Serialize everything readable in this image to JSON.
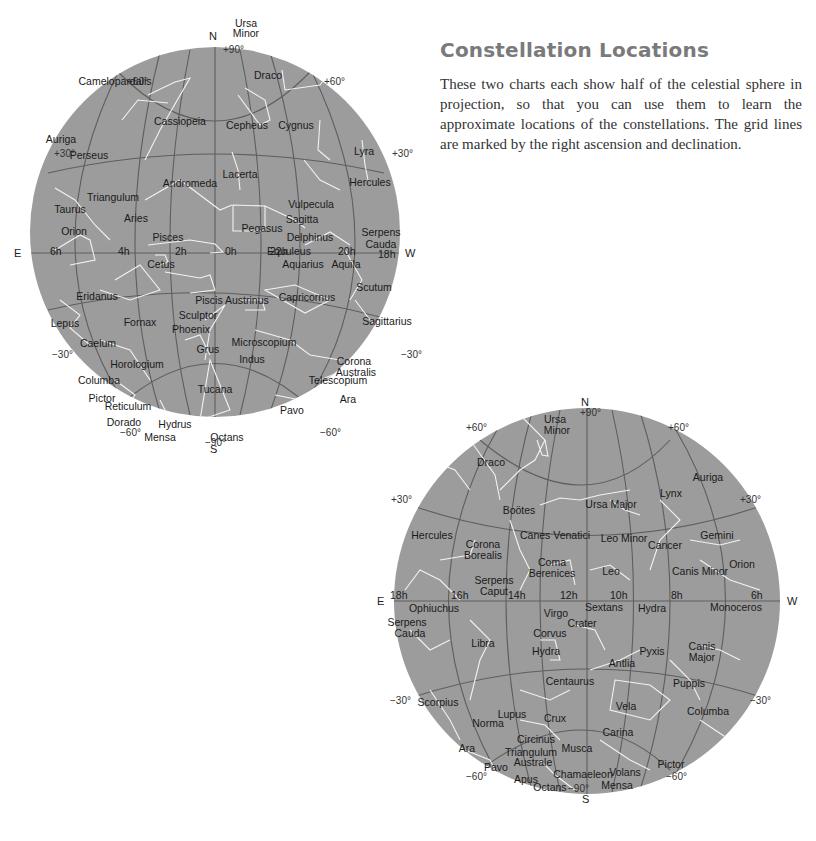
{
  "header": {
    "title": "Constellation Locations",
    "description": "These two charts each show half of the celestial sphere in projection, so that you can use them to learn the approximate locations of the constellations. The grid lines are marked by the right ascension and declination."
  },
  "colors": {
    "sphere_fill": "#9c9c9c",
    "grid_line": "#5e5e5e",
    "constellation_line": "#f2f2f2",
    "title": "#7a7a7a"
  },
  "chart1": {
    "directions": {
      "north": "N",
      "south": "S",
      "east": "E",
      "west": "W"
    },
    "dec_labels": {
      "pole_n": "+90°",
      "pole_s": "−90°",
      "p60": "+60°",
      "p30": "+30°",
      "m30": "−30°",
      "m60": "−60°"
    },
    "ra_labels": [
      "6h",
      "4h",
      "2h",
      "0h",
      "22h",
      "20h",
      "18h"
    ],
    "constellations": [
      {
        "name": "Ursa",
        "x": 246,
        "y": 27
      },
      {
        "name": "Minor",
        "x": 246,
        "y": 37
      },
      {
        "name": "Draco",
        "x": 268,
        "y": 79
      },
      {
        "name": "Camelopardalis",
        "x": 115,
        "y": 85
      },
      {
        "name": "Cassiopeia",
        "x": 180,
        "y": 125
      },
      {
        "name": "Cepheus",
        "x": 247,
        "y": 129
      },
      {
        "name": "Cygnus",
        "x": 296,
        "y": 129
      },
      {
        "name": "Auriga",
        "x": 61,
        "y": 143
      },
      {
        "name": "Perseus",
        "x": 89,
        "y": 159
      },
      {
        "name": "Lyra",
        "x": 364,
        "y": 155
      },
      {
        "name": "Lacerta",
        "x": 240,
        "y": 178
      },
      {
        "name": "Andromeda",
        "x": 190,
        "y": 187
      },
      {
        "name": "Hercules",
        "x": 370,
        "y": 186
      },
      {
        "name": "Triangulum",
        "x": 113,
        "y": 201
      },
      {
        "name": "Vulpecula",
        "x": 311,
        "y": 208
      },
      {
        "name": "Taurus",
        "x": 70,
        "y": 213
      },
      {
        "name": "Aries",
        "x": 136,
        "y": 222
      },
      {
        "name": "Sagitta",
        "x": 302,
        "y": 223
      },
      {
        "name": "Pegasus",
        "x": 262,
        "y": 232
      },
      {
        "name": "Orion",
        "x": 74,
        "y": 235
      },
      {
        "name": "Serpens",
        "x": 381,
        "y": 236
      },
      {
        "name": "Cauda",
        "x": 381,
        "y": 248
      },
      {
        "name": "Pisces",
        "x": 168,
        "y": 241
      },
      {
        "name": "Delphinus",
        "x": 310,
        "y": 241
      },
      {
        "name": "Equuleus",
        "x": 289,
        "y": 255
      },
      {
        "name": "Cetus",
        "x": 161,
        "y": 268
      },
      {
        "name": "Aquarius",
        "x": 303,
        "y": 268
      },
      {
        "name": "Aquila",
        "x": 346,
        "y": 268
      },
      {
        "name": "Eridanus",
        "x": 97,
        "y": 300
      },
      {
        "name": "Scutum",
        "x": 374,
        "y": 291
      },
      {
        "name": "Piscis Austrinus",
        "x": 232,
        "y": 304
      },
      {
        "name": "Capricornus",
        "x": 307,
        "y": 301
      },
      {
        "name": "Sculptor",
        "x": 198,
        "y": 319
      },
      {
        "name": "Sagittarius",
        "x": 387,
        "y": 325
      },
      {
        "name": "Lepus",
        "x": 65,
        "y": 327
      },
      {
        "name": "Fornax",
        "x": 140,
        "y": 326
      },
      {
        "name": "Phoenix",
        "x": 191,
        "y": 333
      },
      {
        "name": "Caelum",
        "x": 98,
        "y": 347
      },
      {
        "name": "Grus",
        "x": 208,
        "y": 353
      },
      {
        "name": "Microscopium",
        "x": 264,
        "y": 346
      },
      {
        "name": "Indus",
        "x": 252,
        "y": 363
      },
      {
        "name": "Corona",
        "x": 354,
        "y": 365
      },
      {
        "name": "Australis",
        "x": 356,
        "y": 376
      },
      {
        "name": "Horologium",
        "x": 137,
        "y": 368
      },
      {
        "name": "Columba",
        "x": 99,
        "y": 384
      },
      {
        "name": "Telescopium",
        "x": 338,
        "y": 384
      },
      {
        "name": "Tucana",
        "x": 215,
        "y": 393
      },
      {
        "name": "Pictor",
        "x": 102,
        "y": 402
      },
      {
        "name": "Ara",
        "x": 348,
        "y": 403
      },
      {
        "name": "Reticulum",
        "x": 128,
        "y": 410
      },
      {
        "name": "Pavo",
        "x": 292,
        "y": 414
      },
      {
        "name": "Dorado",
        "x": 124,
        "y": 426
      },
      {
        "name": "Hydrus",
        "x": 175,
        "y": 428
      },
      {
        "name": "Mensa",
        "x": 160,
        "y": 441
      },
      {
        "name": "Octans",
        "x": 227,
        "y": 441
      }
    ]
  },
  "chart2": {
    "directions": {
      "north": "N",
      "south": "S",
      "east": "E",
      "west": "W"
    },
    "dec_labels": {
      "pole_n": "+90°",
      "pole_s": "−90°",
      "p60": "+60°",
      "p30": "+30°",
      "m30": "−30°",
      "m60": "−60°"
    },
    "ra_labels": [
      "18h",
      "16h",
      "14h",
      "12h",
      "10h",
      "8h",
      "6h"
    ],
    "constellations": [
      {
        "name": "Ursa",
        "x": 555,
        "y": 423
      },
      {
        "name": "Minor",
        "x": 557,
        "y": 434
      },
      {
        "name": "Draco",
        "x": 491,
        "y": 466
      },
      {
        "name": "Auriga",
        "x": 708,
        "y": 481
      },
      {
        "name": "Lynx",
        "x": 671,
        "y": 497
      },
      {
        "name": "Ursa Major",
        "x": 611,
        "y": 508
      },
      {
        "name": "Boötes",
        "x": 519,
        "y": 514
      },
      {
        "name": "Hercules",
        "x": 432,
        "y": 539
      },
      {
        "name": "Canes Venatici",
        "x": 555,
        "y": 539
      },
      {
        "name": "Leo Minor",
        "x": 624,
        "y": 542
      },
      {
        "name": "Gemini",
        "x": 717,
        "y": 539
      },
      {
        "name": "Corona",
        "x": 483,
        "y": 548
      },
      {
        "name": "Borealis",
        "x": 483,
        "y": 559
      },
      {
        "name": "Cancer",
        "x": 665,
        "y": 549
      },
      {
        "name": "Coma",
        "x": 552,
        "y": 566
      },
      {
        "name": "Berenices",
        "x": 552,
        "y": 577
      },
      {
        "name": "Leo",
        "x": 611,
        "y": 575
      },
      {
        "name": "Orion",
        "x": 742,
        "y": 568
      },
      {
        "name": "Canis Minor",
        "x": 700,
        "y": 575
      },
      {
        "name": "Serpens",
        "x": 494,
        "y": 584
      },
      {
        "name": "Caput",
        "x": 494,
        "y": 595
      },
      {
        "name": "Ophiuchus",
        "x": 434,
        "y": 612
      },
      {
        "name": "Sextans",
        "x": 604,
        "y": 611
      },
      {
        "name": "Hydra",
        "x": 652,
        "y": 612
      },
      {
        "name": "Monoceros",
        "x": 736,
        "y": 611
      },
      {
        "name": "Virgo",
        "x": 556,
        "y": 617
      },
      {
        "name": "Crater",
        "x": 582,
        "y": 627
      },
      {
        "name": "Serpens",
        "x": 407,
        "y": 626
      },
      {
        "name": "Cauda",
        "x": 410,
        "y": 637
      },
      {
        "name": "Corvus",
        "x": 550,
        "y": 637
      },
      {
        "name": "Libra",
        "x": 483,
        "y": 647
      },
      {
        "name": "Hydra",
        "x": 546,
        "y": 655
      },
      {
        "name": "Pyxis",
        "x": 652,
        "y": 655
      },
      {
        "name": "Canis",
        "x": 702,
        "y": 650
      },
      {
        "name": "Major",
        "x": 702,
        "y": 661
      },
      {
        "name": "Antlia",
        "x": 622,
        "y": 667
      },
      {
        "name": "Centaurus",
        "x": 570,
        "y": 685
      },
      {
        "name": "Puppis",
        "x": 689,
        "y": 687
      },
      {
        "name": "Scorpius",
        "x": 438,
        "y": 706
      },
      {
        "name": "Vela",
        "x": 626,
        "y": 710
      },
      {
        "name": "Columba",
        "x": 708,
        "y": 715
      },
      {
        "name": "Lupus",
        "x": 512,
        "y": 718
      },
      {
        "name": "Norma",
        "x": 488,
        "y": 727
      },
      {
        "name": "Crux",
        "x": 555,
        "y": 722
      },
      {
        "name": "Carina",
        "x": 618,
        "y": 736
      },
      {
        "name": "Circinus",
        "x": 536,
        "y": 743
      },
      {
        "name": "Musca",
        "x": 577,
        "y": 752
      },
      {
        "name": "Ara",
        "x": 467,
        "y": 752
      },
      {
        "name": "Triangulum",
        "x": 531,
        "y": 756
      },
      {
        "name": "Australe",
        "x": 533,
        "y": 766
      },
      {
        "name": "Pictor",
        "x": 671,
        "y": 768
      },
      {
        "name": "Pavo",
        "x": 496,
        "y": 771
      },
      {
        "name": "Chamaeleon",
        "x": 583,
        "y": 778
      },
      {
        "name": "Volans",
        "x": 625,
        "y": 776
      },
      {
        "name": "Apus",
        "x": 526,
        "y": 783
      },
      {
        "name": "Mensa",
        "x": 617,
        "y": 789
      },
      {
        "name": "Octans",
        "x": 550,
        "y": 791
      }
    ]
  }
}
